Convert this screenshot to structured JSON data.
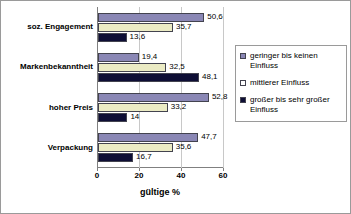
{
  "chart_data": {
    "type": "bar",
    "orientation": "horizontal",
    "title": "",
    "xlabel": "gültige %",
    "ylabel": "",
    "xlim": [
      0,
      60
    ],
    "xticks": [
      "0",
      "20",
      "40",
      "60"
    ],
    "grid": "vertical",
    "legend_position": "right",
    "categories": [
      "soz. Engagement",
      "Markenbekanntheit",
      "hoher Preis",
      "Verpackung"
    ],
    "series": [
      {
        "name": "geringer bis keinen Einfluss",
        "color": "#8a87b5",
        "values": [
          50.6,
          19.4,
          52.8,
          47.7
        ],
        "labels": [
          "50,6",
          "19,4",
          "52,8",
          "47,7"
        ]
      },
      {
        "name": "mittlerer Einfluss",
        "color": "#ebebc4",
        "legend_color": "#ffffff",
        "values": [
          35.7,
          32.5,
          33.2,
          35.6
        ],
        "labels": [
          "35,7",
          "32,5",
          "33,2",
          "35,6"
        ]
      },
      {
        "name": "großer bis sehr großer Einfluss",
        "color": "#0e0e35",
        "values": [
          13.6,
          48.1,
          14.0,
          16.7
        ],
        "labels": [
          "13,6",
          "48,1",
          "14",
          "16,7"
        ]
      }
    ]
  },
  "legend": {
    "items": [
      {
        "label": "geringer bis keinen Einfluss"
      },
      {
        "label": "mittlerer Einfluss"
      },
      {
        "label": "großer bis sehr großer Einfluss"
      }
    ]
  }
}
